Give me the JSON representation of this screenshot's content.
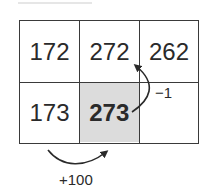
{
  "grid": {
    "rows": [
      [
        {
          "value": "172"
        },
        {
          "value": "272"
        },
        {
          "value": "262"
        }
      ],
      [
        {
          "value": "173"
        },
        {
          "value": "273",
          "highlighted": true
        },
        {
          "value": ""
        }
      ]
    ]
  },
  "annotations": {
    "up_arrow_label": "−1",
    "right_arrow_label": "+100"
  },
  "colors": {
    "border": "#3a3a3a",
    "highlight": "#dcdcdc"
  }
}
